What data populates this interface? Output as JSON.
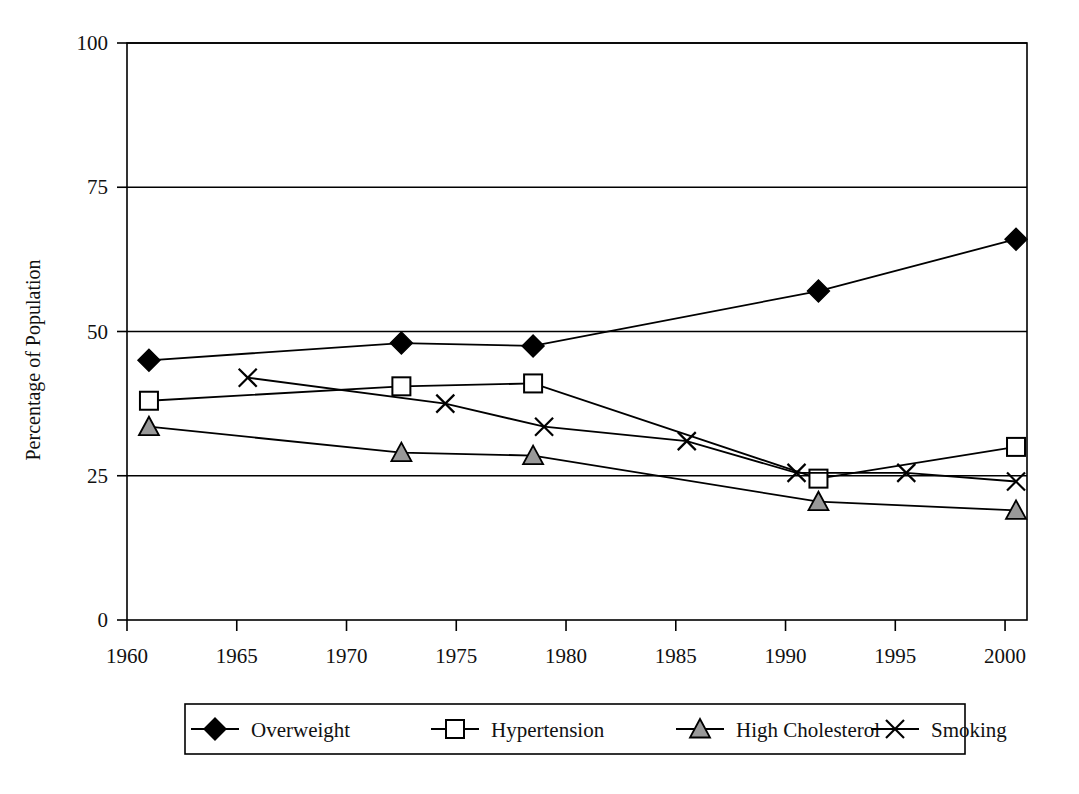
{
  "chart_data": {
    "type": "line",
    "title": "",
    "subtitle": "",
    "xlabel": "",
    "ylabel": "Percentage of Population",
    "xlim": [
      1960,
      2001
    ],
    "ylim": [
      0,
      100
    ],
    "grid": true,
    "grid_axis": "y",
    "legend_position": "bottom",
    "y_ticks": [
      "0",
      "25",
      "50",
      "75",
      "100"
    ],
    "y_tick_values": [
      0,
      25,
      50,
      75,
      100
    ],
    "x_ticks": [
      "1960",
      "1965",
      "1970",
      "1975",
      "1980",
      "1985",
      "1990",
      "1995",
      "2000"
    ],
    "x_tick_values": [
      1960,
      1965,
      1970,
      1975,
      1980,
      1985,
      1990,
      1995,
      2000
    ],
    "series": [
      {
        "name": "Overweight",
        "marker": "filled-diamond",
        "color": "#000000",
        "marker_fill": "#000000",
        "x": [
          1961,
          1972.5,
          1978.5,
          1991.5,
          2000.5
        ],
        "values": [
          45,
          48,
          47.5,
          57,
          66
        ]
      },
      {
        "name": "Hypertension",
        "marker": "open-square",
        "color": "#000000",
        "marker_fill": "#ffffff",
        "x": [
          1961,
          1972.5,
          1978.5,
          1991.5,
          2000.5
        ],
        "values": [
          38,
          40.5,
          41,
          24.5,
          30
        ]
      },
      {
        "name": "High Cholesterol",
        "marker": "gray-triangle",
        "color": "#000000",
        "marker_fill": "#999999",
        "x": [
          1961,
          1972.5,
          1978.5,
          1991.5,
          2000.5
        ],
        "values": [
          33.5,
          29,
          28.5,
          20.5,
          19
        ]
      },
      {
        "name": "Smoking",
        "marker": "x-cross",
        "color": "#000000",
        "marker_fill": "none",
        "x": [
          1965.5,
          1974.5,
          1979,
          1985.5,
          1990.5,
          1995.5,
          2000.5
        ],
        "values": [
          42,
          37.5,
          33.5,
          31,
          25.5,
          25.5,
          24
        ]
      }
    ]
  },
  "legend": {
    "items": [
      {
        "label": "Overweight",
        "marker": "filled-diamond"
      },
      {
        "label": "Hypertension",
        "marker": "open-square"
      },
      {
        "label": "High Cholesterol",
        "marker": "gray-triangle"
      },
      {
        "label": "Smoking",
        "marker": "x-cross"
      }
    ]
  },
  "colors": {
    "line": "#000000",
    "grid": "#000000",
    "axis": "#000000",
    "triangle_fill": "#999999",
    "background": "#ffffff"
  }
}
